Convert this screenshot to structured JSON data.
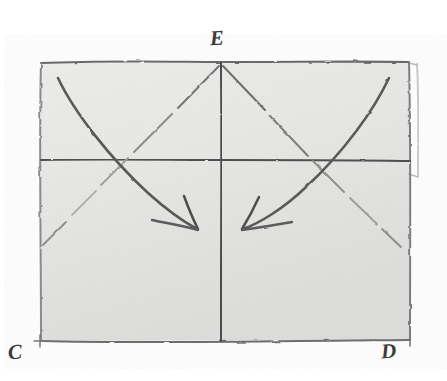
{
  "figure": {
    "kind": "hand-drawn-geometry-sketch",
    "title_text": "",
    "medium": "pencil-on-paper",
    "canvas": {
      "width": 447,
      "height": 381
    },
    "colors": {
      "paper_outside": "#ffffff",
      "paper_inside": "#e9e9e9",
      "paper_inside_shade": "#dededd",
      "stroke_dark": "#4a4a4a",
      "stroke_mid": "#6f6f6f",
      "stroke_light": "#9a9a9a",
      "stroke_faint": "#c2c2c2",
      "label_color": "#3b3b3b"
    }
  },
  "labels": {
    "apex": "E",
    "bottom_left": "C",
    "bottom_right": "D"
  },
  "shapes": {
    "rectangle": {
      "name": "outer-rectangle",
      "left": 40,
      "top": 62,
      "right": 410,
      "bottom": 341
    },
    "vertical_axis": {
      "name": "vertical-center-line",
      "x": 221,
      "y_top": 63,
      "y_bottom": 341
    },
    "horizontal_axis": {
      "name": "horizontal-mid-line",
      "y": 160,
      "x_left": 40,
      "x_right": 410
    },
    "edge_artifact": {
      "name": "right-edge-double-stroke",
      "x": 418,
      "y_top": 64,
      "y_bottom": 176
    }
  },
  "strokes": {
    "diagonal_left": {
      "name": "diagonal-from-apex-down-left",
      "from": [
        221,
        63
      ],
      "to": [
        42,
        245
      ],
      "style": "broken-light"
    },
    "diagonal_right": {
      "name": "diagonal-from-apex-down-right",
      "from": [
        221,
        63
      ],
      "to": [
        400,
        245
      ],
      "style": "broken-light"
    },
    "curve_left": {
      "name": "left-curved-arrow",
      "from": [
        58,
        78
      ],
      "to": [
        197,
        228
      ],
      "arrow_direction": "down-right",
      "style": "solid-dark-curved"
    },
    "curve_right": {
      "name": "right-curved-arrow",
      "from": [
        389,
        78
      ],
      "to": [
        243,
        228
      ],
      "arrow_direction": "down-left",
      "style": "solid-dark-curved"
    }
  },
  "ticks": {
    "corner_tick_C": {
      "name": "corner-tick-bottom-left",
      "x": 40,
      "y": 341
    },
    "corner_tick_D": {
      "name": "corner-tick-bottom-right",
      "x": 410,
      "y": 341
    }
  }
}
